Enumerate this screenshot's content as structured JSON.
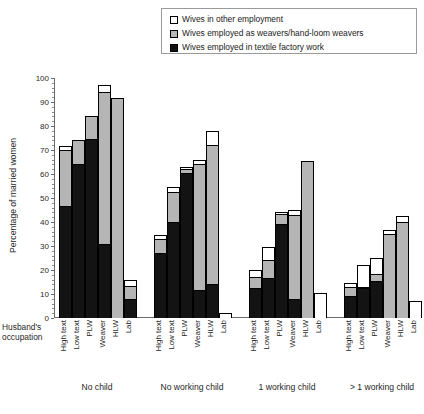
{
  "legend": {
    "items": [
      {
        "key": "other",
        "label": "Wives in other employment",
        "swatch": "white-square-icon",
        "color": "#ffffff"
      },
      {
        "key": "weaver",
        "label": "Wives employed as weavers/hand-loom weavers",
        "swatch": "gray-square-icon",
        "color": "#b5b5b5"
      },
      {
        "key": "factory",
        "label": "Wives employed in textile factory work",
        "swatch": "black-square-icon",
        "color": "#131313"
      }
    ]
  },
  "axes": {
    "ylabel": "Percentage of married women",
    "yticks": [
      "0",
      "10",
      "20",
      "30",
      "40",
      "50",
      "60",
      "70",
      "80",
      "90",
      "100"
    ],
    "row_header": "Husband's occupation",
    "row_header_line1": "Husband's",
    "row_header_line2": "occupation"
  },
  "chart_data": {
    "type": "bar",
    "title": "",
    "subtitle": "",
    "xlabel": "Husband's occupation",
    "ylabel": "Percentage of married women",
    "ylim": [
      0,
      100
    ],
    "ytick_step": 10,
    "grid": false,
    "stacked": true,
    "legend_position": "top-right",
    "group_labels": [
      "No child",
      "No working child",
      "1 working child",
      "> 1 working child"
    ],
    "categories": [
      "High text",
      "Low text",
      "PLW",
      "Weaver",
      "HLW",
      "Lab"
    ],
    "series": [
      {
        "name": "Wives employed in textile factory work",
        "color": "#131313",
        "values_by_group": {
          "No child": [
            46.5,
            64.0,
            74.5,
            31.0,
            0.0,
            8.0
          ],
          "No working child": [
            27.0,
            40.0,
            60.5,
            11.5,
            14.0,
            0.0
          ],
          "1 working child": [
            12.5,
            16.5,
            39.0,
            8.0,
            0.0,
            0.0
          ],
          "> 1 working child": [
            9.0,
            12.5,
            15.5,
            0.0,
            0.0,
            0.0
          ]
        }
      },
      {
        "name": "Wives employed as weavers/hand-loom weavers",
        "color": "#b5b5b5",
        "values_by_group": {
          "No child": [
            23.5,
            10.0,
            9.5,
            63.0,
            91.5,
            5.5
          ],
          "No working child": [
            6.0,
            12.5,
            1.5,
            52.5,
            58.0,
            0.0
          ],
          "1 working child": [
            4.5,
            7.5,
            4.5,
            35.0,
            65.5,
            0.0
          ],
          "> 1 working child": [
            4.0,
            0.5,
            3.0,
            35.0,
            40.0,
            0.0
          ]
        }
      },
      {
        "name": "Wives in other employment",
        "color": "#ffffff",
        "values_by_group": {
          "No child": [
            1.5,
            0.0,
            0.0,
            3.0,
            0.0,
            2.5
          ],
          "No working child": [
            1.5,
            2.0,
            1.0,
            2.0,
            6.0,
            2.0
          ],
          "1 working child": [
            3.0,
            5.5,
            0.5,
            2.0,
            0.0,
            10.5
          ],
          "> 1 working child": [
            1.5,
            9.0,
            6.5,
            1.5,
            2.5,
            7.0
          ]
        }
      }
    ],
    "totals_by_group": {
      "No child": [
        71.5,
        74.0,
        84.0,
        97.0,
        91.5,
        16.0
      ],
      "No working child": [
        34.5,
        54.5,
        63.0,
        66.0,
        78.0,
        2.0
      ],
      "1 working child": [
        20.0,
        29.5,
        44.0,
        45.0,
        65.5,
        10.5
      ],
      "> 1 working child": [
        14.5,
        22.0,
        25.0,
        36.5,
        42.5,
        7.0
      ]
    }
  }
}
